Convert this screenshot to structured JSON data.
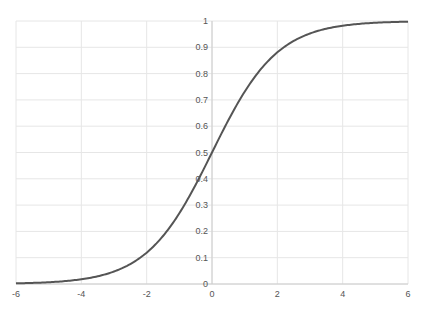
{
  "chart_data": {
    "type": "line",
    "title": "",
    "xlabel": "",
    "ylabel": "",
    "xlim": [
      -6,
      6
    ],
    "ylim": [
      0,
      1
    ],
    "grid": true,
    "legend": null,
    "x_ticks": [
      -6,
      -4,
      -2,
      0,
      2,
      4,
      6
    ],
    "x_tick_labels": [
      "-6",
      "-4",
      "-2",
      "0",
      "2",
      "4",
      "6"
    ],
    "y_ticks": [
      0,
      0.1,
      0.2,
      0.3,
      0.4,
      0.5,
      0.6,
      0.7,
      0.8,
      0.9,
      1
    ],
    "y_tick_labels": [
      "0",
      "0.1",
      "0.2",
      "0.3",
      "0.4",
      "0.5",
      "0.6",
      "0.7",
      "0.8",
      "0.9",
      "1"
    ],
    "series": [
      {
        "name": "sigmoid",
        "color": "#555555",
        "x": [
          -6,
          -5,
          -4,
          -3,
          -2,
          -1.5,
          -1,
          -0.5,
          0,
          0.5,
          1,
          1.5,
          2,
          3,
          4,
          5,
          6
        ],
        "values": [
          0.0025,
          0.0067,
          0.018,
          0.047,
          0.119,
          0.182,
          0.269,
          0.378,
          0.5,
          0.622,
          0.731,
          0.818,
          0.881,
          0.953,
          0.982,
          0.993,
          0.9975
        ]
      }
    ]
  },
  "colors": {
    "line": "#555555",
    "grid": "#e6e6e6",
    "axis": "#cccccc",
    "text": "#555555"
  }
}
